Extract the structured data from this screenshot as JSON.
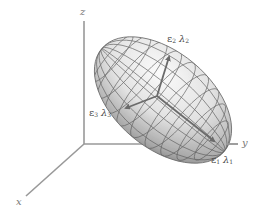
{
  "diagram": {
    "title": "",
    "axes": {
      "x": {
        "label": "x"
      },
      "y": {
        "label": "y"
      },
      "z": {
        "label": "z"
      }
    },
    "ellipsoid": {
      "fill_light": "#f4f4f4",
      "fill_dark": "#7a7a7a",
      "grid_color": "#5a5a5a"
    },
    "eigenvectors": [
      {
        "id": "e1",
        "vector": "ε",
        "vector_sub": "1",
        "value": "λ",
        "value_sub": "1"
      },
      {
        "id": "e2",
        "vector": "ε",
        "vector_sub": "2",
        "value": "λ",
        "value_sub": "2"
      },
      {
        "id": "e3",
        "vector": "ε",
        "vector_sub": "3",
        "value": "λ",
        "value_sub": "3"
      }
    ],
    "colors": {
      "axis": "#999999",
      "arrow": "#6b6b6b",
      "label": "#4a4a4a"
    }
  }
}
